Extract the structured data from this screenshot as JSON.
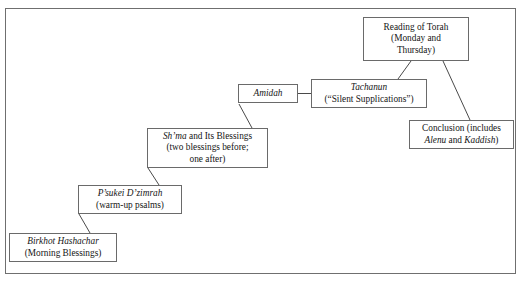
{
  "figure": {
    "frame_color": "#6f6f6f",
    "box_border_color": "#6a6a6a",
    "connector_color": "#4a4a4a",
    "background": "#ffffff"
  },
  "nodes": {
    "birkhot": {
      "name": "Birkhot Hashachar",
      "line1": "Birkhot Hashachar",
      "line2": "(Morning Blessings)"
    },
    "psukei": {
      "name": "P'sukei D'zimrah",
      "line1": "P’sukei D’zimrah",
      "line2": "(warm-up psalms)"
    },
    "shma": {
      "name": "Sh'ma and Its Blessings",
      "line1_italic": "Sh’ma",
      "line1_rest": " and Its Blessings",
      "line2": "(two blessings before;",
      "line3": "one after)"
    },
    "amidah": {
      "name": "Amidah",
      "line1": "Amidah"
    },
    "tachanun": {
      "name": "Tachanun",
      "line1": "Tachanun",
      "line2": "(“Silent Supplications”)"
    },
    "torah": {
      "name": "Reading of Torah",
      "line1": "Reading of Torah",
      "line2": "(Monday and",
      "line3": "Thursday)"
    },
    "conclusion": {
      "name": "Conclusion",
      "line1": "Conclusion (includes",
      "line2_italic_a": "Alenu",
      "line2_mid": " and ",
      "line2_italic_b": "Kaddish",
      "line2_end": ")"
    }
  },
  "connectors": [
    {
      "from": "birkhot",
      "to": "psukei",
      "style": "diagonal"
    },
    {
      "from": "psukei",
      "to": "shma",
      "style": "diagonal"
    },
    {
      "from": "shma",
      "to": "amidah",
      "style": "diagonal"
    },
    {
      "from": "amidah",
      "to": "tachanun",
      "style": "horizontal"
    },
    {
      "from": "tachanun",
      "to": "torah",
      "style": "diagonal"
    },
    {
      "from": "torah",
      "to": "conclusion",
      "style": "diagonal"
    }
  ]
}
